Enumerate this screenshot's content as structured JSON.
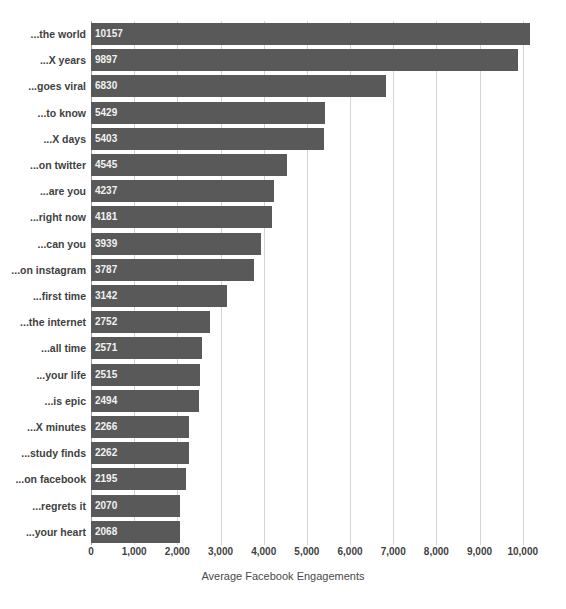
{
  "chart_data": {
    "type": "bar",
    "orientation": "horizontal",
    "title": "",
    "xlabel": "Average Facebook Engagements",
    "ylabel": "",
    "xlim": [
      0,
      10400
    ],
    "grid": true,
    "legend": null,
    "bar_color": "#595959",
    "gridline_color": "#d4d4d4",
    "value_label_color": "#f2f2f2",
    "xticks": [
      0,
      1000,
      2000,
      3000,
      4000,
      5000,
      6000,
      7000,
      8000,
      9000,
      10000
    ],
    "xtick_labels": [
      "0",
      "1,000",
      "2,000",
      "3,000",
      "4,000",
      "5,000",
      "6,000",
      "7,000",
      "8,000",
      "9,000",
      "10,000"
    ],
    "categories": [
      "...the world",
      "...X years",
      "...goes viral",
      "...to know",
      "...X days",
      "...on twitter",
      "...are you",
      "...right now",
      "...can you",
      "...on instagram",
      "...first time",
      "...the internet",
      "...all time",
      "...your life",
      "...is epic",
      "...X minutes",
      "...study finds",
      "...on facebook",
      "...regrets it",
      "...your heart"
    ],
    "values": [
      10157,
      9897,
      6830,
      5429,
      5403,
      4545,
      4237,
      4181,
      3939,
      3787,
      3142,
      2752,
      2571,
      2515,
      2494,
      2266,
      2262,
      2195,
      2070,
      2068
    ],
    "value_labels": [
      "10157",
      "9897",
      "6830",
      "5429",
      "5403",
      "4545",
      "4237",
      "4181",
      "3939",
      "3787",
      "3142",
      "2752",
      "2571",
      "2515",
      "2494",
      "2266",
      "2262",
      "2195",
      "2070",
      "2068"
    ]
  }
}
